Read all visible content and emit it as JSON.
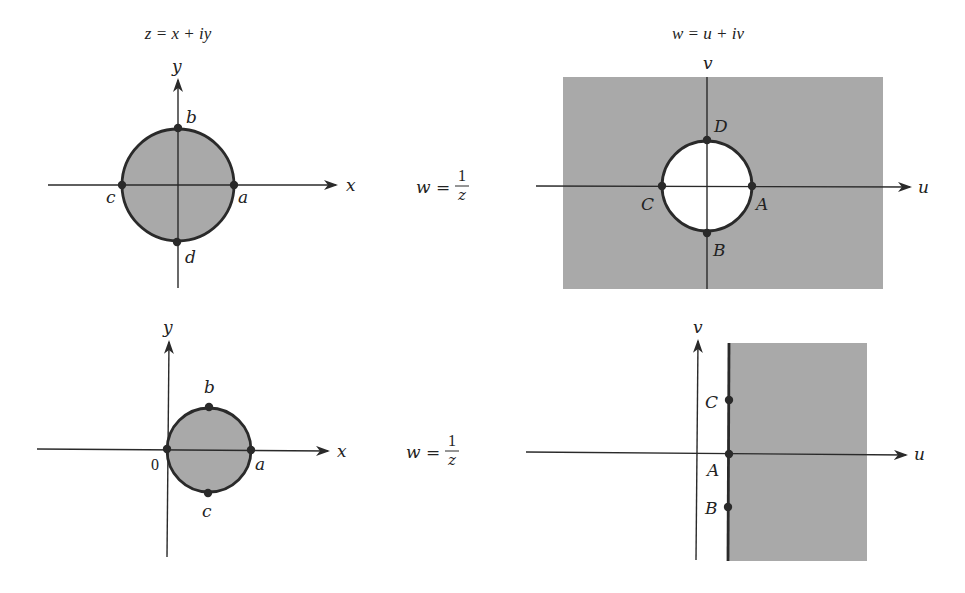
{
  "titles": {
    "z_plane": "z = x + iy",
    "w_plane": "w = u + iv"
  },
  "mapping": {
    "label_w": "w =",
    "numerator": "1",
    "denominator": "z"
  },
  "top_left": {
    "x_axis": "x",
    "y_axis": "y",
    "points": {
      "a": "a",
      "b": "b",
      "c": "c",
      "d": "d"
    }
  },
  "top_right": {
    "u_axis": "u",
    "v_axis": "v",
    "points": {
      "A": "A",
      "B": "B",
      "C": "C",
      "D": "D"
    }
  },
  "bottom_left": {
    "x_axis": "x",
    "y_axis": "y",
    "origin": "0",
    "points": {
      "a": "a",
      "b": "b",
      "c": "c"
    }
  },
  "bottom_right": {
    "u_axis": "u",
    "v_axis": "v",
    "points": {
      "A": "A",
      "B": "B",
      "C": "C"
    }
  },
  "colors": {
    "shade": "#a9a9a9",
    "ink": "#2a2a2a"
  }
}
